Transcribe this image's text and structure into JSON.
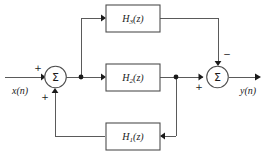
{
  "figure": {
    "type": "signal-flow-block-diagram",
    "background_color": "#ffffff",
    "line_color": "#5a5a5a",
    "text_color": "#1a1a1a"
  },
  "io": {
    "input_label": "x(n)",
    "output_label": "y(n)"
  },
  "blocks": [
    {
      "id": "h3",
      "label_base": "H",
      "label_sub": "3",
      "label_tail": "(z)",
      "position": "top-forward-path"
    },
    {
      "id": "h2",
      "label_base": "H",
      "label_sub": "2",
      "label_tail": "(z)",
      "position": "middle-forward-path"
    },
    {
      "id": "h1",
      "label_base": "H",
      "label_sub": "1",
      "label_tail": "(z)",
      "position": "bottom-feedback-path"
    }
  ],
  "summers": [
    {
      "id": "left-summer",
      "glyph": "Σ",
      "signs": {
        "input_from_x": "+",
        "input_from_h1": "+"
      }
    },
    {
      "id": "right-summer",
      "glyph": "Σ",
      "signs": {
        "input_from_h2": "+",
        "input_from_h3": "−"
      }
    }
  ],
  "signs": {
    "plus": "+",
    "minus": "−"
  }
}
